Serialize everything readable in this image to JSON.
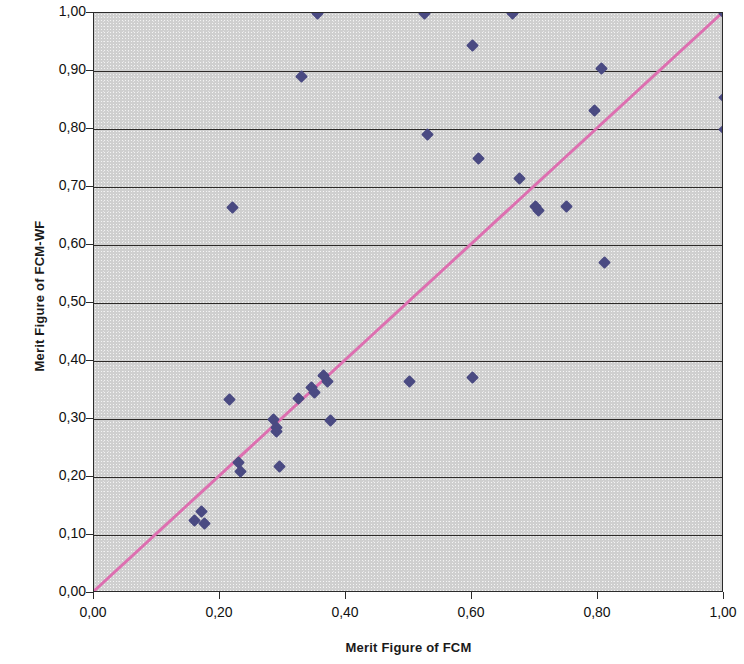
{
  "chart_data": {
    "type": "scatter",
    "title": "",
    "xlabel": "Merit Figure of FCM",
    "ylabel": "Merit Figure of FCM-WF",
    "xlim": [
      0.0,
      1.0
    ],
    "ylim": [
      0.0,
      1.0
    ],
    "grid": true,
    "legend": null,
    "decimal_separator": ",",
    "x_tick_labels": [
      "0,00",
      "0,20",
      "0,40",
      "0,60",
      "0,80",
      "1,00"
    ],
    "x_tick_values": [
      0.0,
      0.2,
      0.4,
      0.6,
      0.8,
      1.0
    ],
    "y_tick_labels": [
      "0,00",
      "0,10",
      "0,20",
      "0,30",
      "0,40",
      "0,50",
      "0,60",
      "0,70",
      "0,80",
      "0,90",
      "1,00"
    ],
    "y_tick_values": [
      0.0,
      0.1,
      0.2,
      0.3,
      0.4,
      0.5,
      0.6,
      0.7,
      0.8,
      0.9,
      1.0
    ],
    "series": [
      {
        "name": "points",
        "marker": "diamond",
        "color": "#4a4a82",
        "points": [
          [
            0.16,
            0.125
          ],
          [
            0.17,
            0.14
          ],
          [
            0.175,
            0.12
          ],
          [
            0.215,
            0.333
          ],
          [
            0.22,
            0.665
          ],
          [
            0.23,
            0.225
          ],
          [
            0.232,
            0.21
          ],
          [
            0.285,
            0.3
          ],
          [
            0.29,
            0.285
          ],
          [
            0.29,
            0.278
          ],
          [
            0.295,
            0.218
          ],
          [
            0.325,
            0.335
          ],
          [
            0.33,
            0.89
          ],
          [
            0.345,
            0.355
          ],
          [
            0.35,
            0.345
          ],
          [
            0.355,
            1.0
          ],
          [
            0.365,
            0.375
          ],
          [
            0.37,
            0.365
          ],
          [
            0.375,
            0.298
          ],
          [
            0.5,
            0.365
          ],
          [
            0.525,
            1.0
          ],
          [
            0.53,
            0.79
          ],
          [
            0.6,
            0.944
          ],
          [
            0.6,
            0.372
          ],
          [
            0.61,
            0.75
          ],
          [
            0.665,
            1.0
          ],
          [
            0.675,
            0.715
          ],
          [
            0.7,
            0.667
          ],
          [
            0.705,
            0.66
          ],
          [
            0.75,
            0.667
          ],
          [
            0.795,
            0.832
          ],
          [
            0.805,
            0.905
          ],
          [
            0.81,
            0.57
          ],
          [
            1.0,
            1.0
          ],
          [
            1.0,
            0.855
          ],
          [
            1.0,
            0.8
          ]
        ]
      }
    ],
    "trendline": {
      "name": "identity-line",
      "color": "#dd6fb0",
      "from": [
        0.0,
        0.0
      ],
      "to": [
        1.0,
        1.0
      ],
      "equation": "y = x"
    }
  }
}
